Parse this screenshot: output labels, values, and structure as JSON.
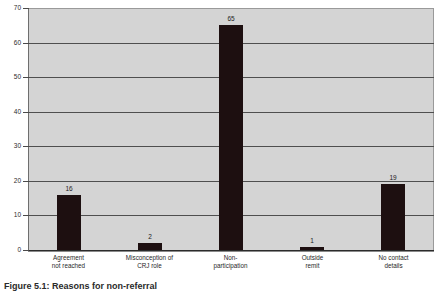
{
  "chart_data": {
    "type": "bar",
    "title": "",
    "xlabel": "",
    "ylabel": "",
    "ylim": [
      0,
      70
    ],
    "grid": true,
    "legend": "none",
    "categories": [
      "Agreement\nnot reached",
      "Misconception of\nCRJ role",
      "Non-\nparticipation",
      "Outside\nremit",
      "No contact\ndetails"
    ],
    "values": [
      16,
      2,
      65,
      1,
      19
    ],
    "value_labels": [
      "16",
      "2",
      "65",
      "1",
      "19"
    ],
    "y_ticks": [
      "0",
      "10",
      "20",
      "30",
      "40",
      "50",
      "60",
      "70"
    ],
    "bar_color": "#1d0f10",
    "plot_background": "#d4d4d4",
    "gridline_color": "#4f4f4f"
  },
  "caption": {
    "text": "Figure 5.1: Reasons for non-referral"
  }
}
